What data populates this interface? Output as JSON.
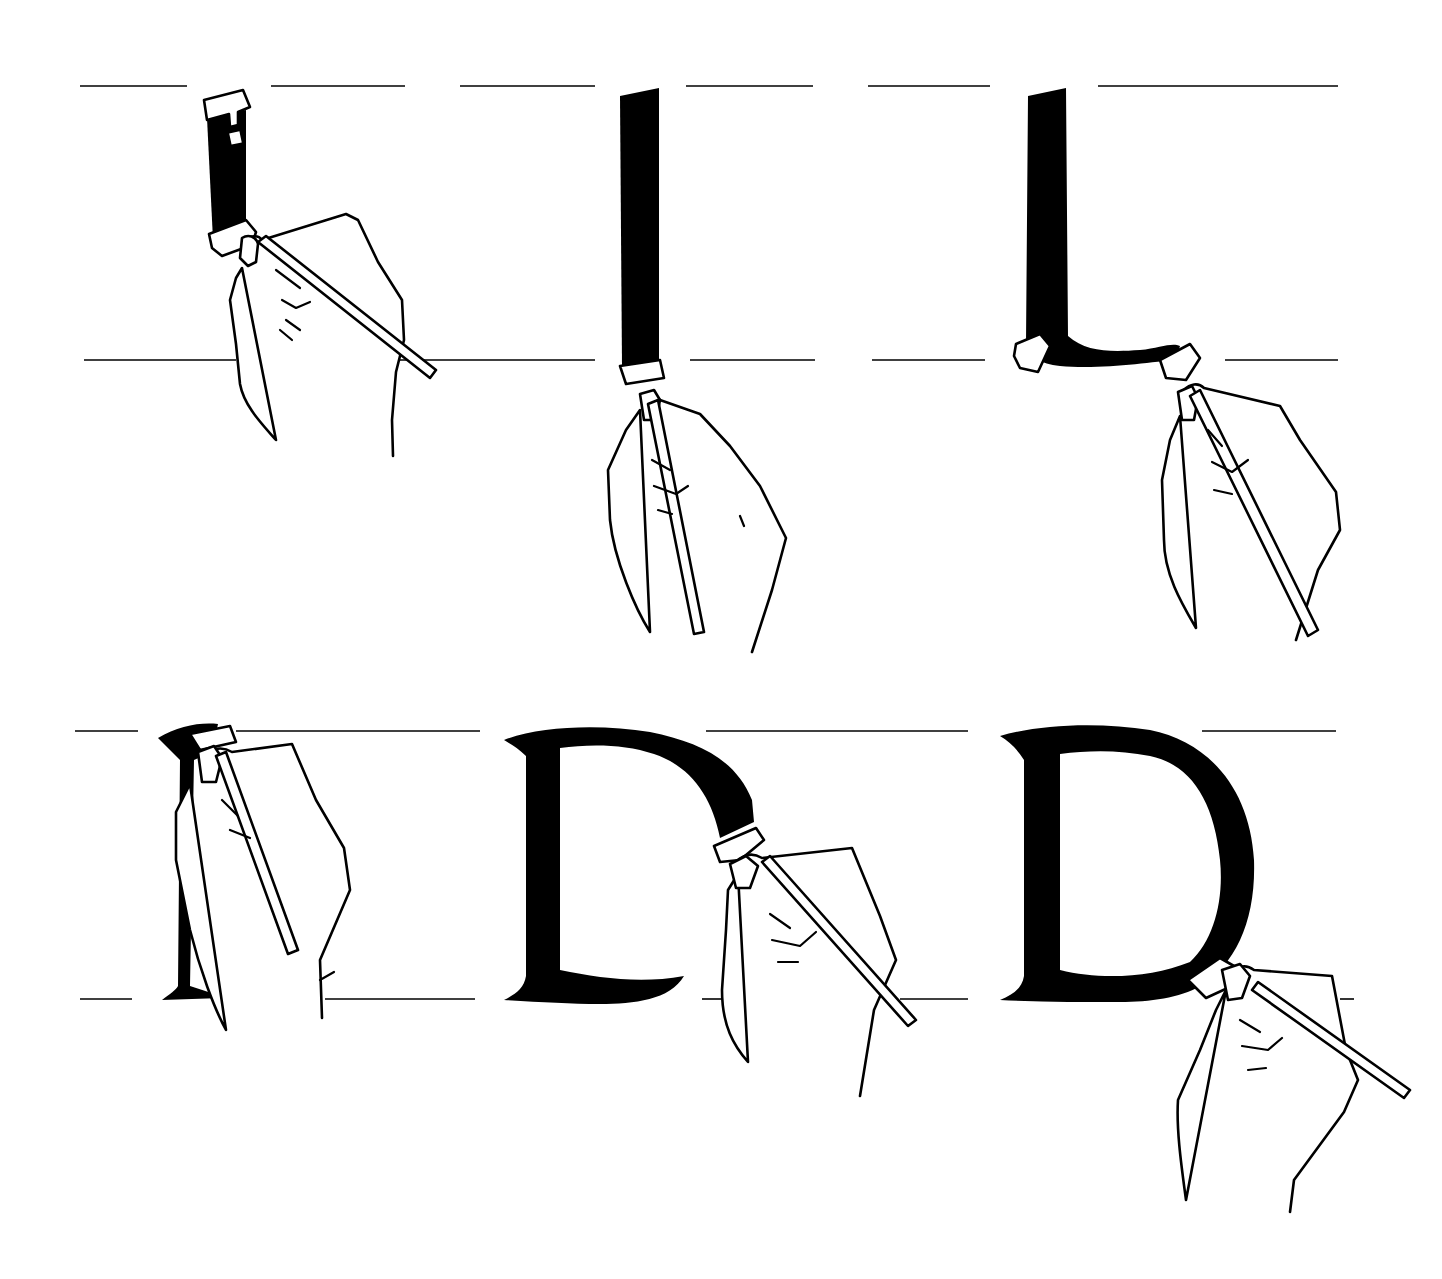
{
  "illustration": {
    "subject": "Broad-nib pen calligraphy: construction of a serif capital letter D",
    "letter": "D",
    "colors": {
      "ink": "#000000",
      "paper": "#ffffff"
    },
    "steps": [
      {
        "index": 1,
        "description": "Pen nib placed at top of guide lines, beginning downward stem stroke"
      },
      {
        "index": 2,
        "description": "Vertical stem stroke completed down to baseline"
      },
      {
        "index": 3,
        "description": "Stem finished with a curved serif stroke along the baseline"
      },
      {
        "index": 4,
        "description": "Pen repositioned at the top of the stem to begin the bowl"
      },
      {
        "index": 5,
        "description": "Bowl stroke drawn from top curving right and downward"
      },
      {
        "index": 6,
        "description": "Bowl joined at the baseline, completing the letter D"
      }
    ]
  }
}
